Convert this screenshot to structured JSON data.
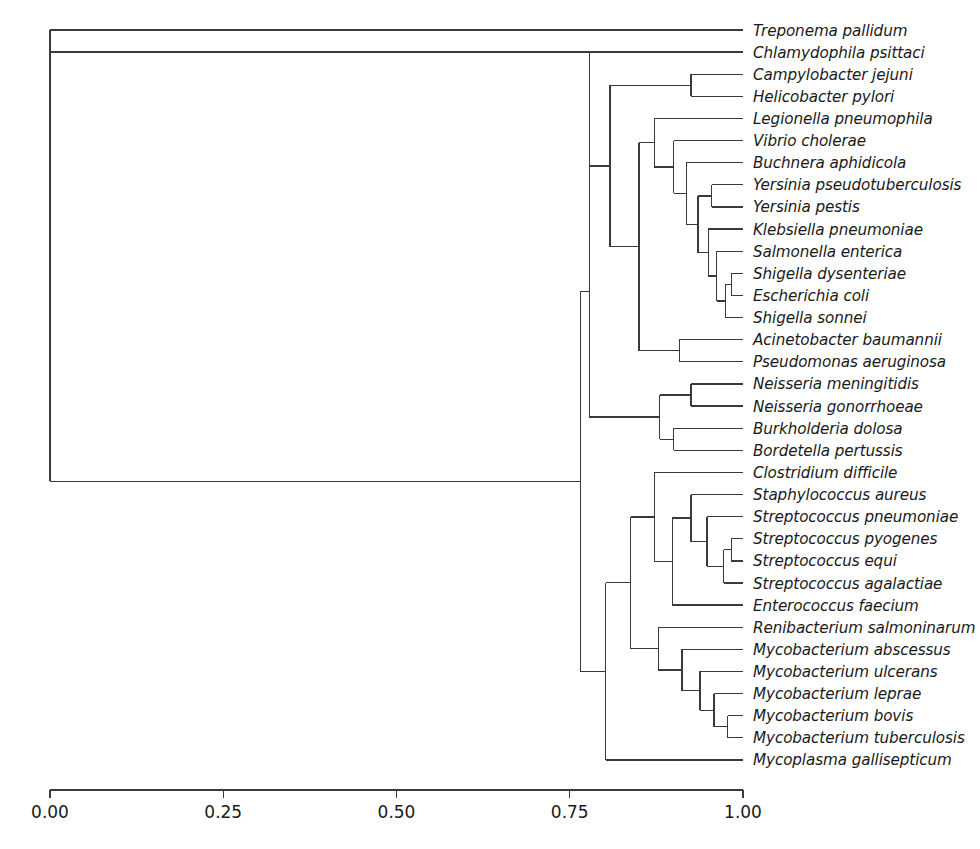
{
  "figure": {
    "type": "dendrogram",
    "title": "",
    "background_color": "#ffffff",
    "line_color": "#3a3a3a",
    "text_color": "#1a1a1a"
  },
  "axis": {
    "orientation": "horizontal-bottom",
    "ticks": [
      "0.00",
      "0.25",
      "0.50",
      "0.75",
      "1.00"
    ],
    "tick_values": [
      0.0,
      0.25,
      0.5,
      0.75,
      1.0
    ],
    "label": "",
    "range": [
      0.0,
      1.0
    ]
  },
  "chart_data": {
    "type": "line",
    "subtype": "dendrogram",
    "title": "",
    "xlabel": "",
    "ylabel": "",
    "xlim": [
      0.0,
      1.0
    ],
    "grid": false,
    "legend": "none",
    "orientation": "left-to-right",
    "leaf_count": 34,
    "leaves": [
      {
        "index": 0,
        "label": "Treponema pallidum",
        "merge_height": 0.0
      },
      {
        "index": 1,
        "label": "Chlamydophila psittaci",
        "merge_height": 0.0
      },
      {
        "index": 2,
        "label": "Campylobacter jejuni",
        "merge_height": 0.0
      },
      {
        "index": 3,
        "label": "Helicobacter pylori",
        "merge_height": 0.0
      },
      {
        "index": 4,
        "label": "Legionella pneumophila",
        "merge_height": 0.0
      },
      {
        "index": 5,
        "label": "Vibrio cholerae",
        "merge_height": 0.0
      },
      {
        "index": 6,
        "label": "Buchnera aphidicola",
        "merge_height": 0.0
      },
      {
        "index": 7,
        "label": "Yersinia pseudotuberculosis",
        "merge_height": 0.0
      },
      {
        "index": 8,
        "label": "Yersinia pestis",
        "merge_height": 0.0
      },
      {
        "index": 9,
        "label": "Klebsiella pneumoniae",
        "merge_height": 0.0
      },
      {
        "index": 10,
        "label": "Salmonella enterica",
        "merge_height": 0.0
      },
      {
        "index": 11,
        "label": "Shigella dysenteriae",
        "merge_height": 0.0
      },
      {
        "index": 12,
        "label": "Escherichia coli",
        "merge_height": 0.0
      },
      {
        "index": 13,
        "label": "Shigella sonnei",
        "merge_height": 0.0
      },
      {
        "index": 14,
        "label": "Acinetobacter baumannii",
        "merge_height": 0.0
      },
      {
        "index": 15,
        "label": "Pseudomonas aeruginosa",
        "merge_height": 0.0
      },
      {
        "index": 16,
        "label": "Neisseria meningitidis",
        "merge_height": 0.0
      },
      {
        "index": 17,
        "label": "Neisseria gonorrhoeae",
        "merge_height": 0.0
      },
      {
        "index": 18,
        "label": "Burkholderia dolosa",
        "merge_height": 0.0
      },
      {
        "index": 19,
        "label": "Bordetella pertussis",
        "merge_height": 0.0
      },
      {
        "index": 20,
        "label": "Clostridium difficile",
        "merge_height": 0.0
      },
      {
        "index": 21,
        "label": "Staphylococcus aureus",
        "merge_height": 0.0
      },
      {
        "index": 22,
        "label": "Streptococcus pneumoniae",
        "merge_height": 0.0
      },
      {
        "index": 23,
        "label": "Streptococcus pyogenes",
        "merge_height": 0.0
      },
      {
        "index": 24,
        "label": "Streptococcus equi",
        "merge_height": 0.0
      },
      {
        "index": 25,
        "label": "Streptococcus agalactiae",
        "merge_height": 0.0
      },
      {
        "index": 26,
        "label": "Enterococcus faecium",
        "merge_height": 0.0
      },
      {
        "index": 27,
        "label": "Renibacterium salmoninarum",
        "merge_height": 0.0
      },
      {
        "index": 28,
        "label": "Mycobacterium abscessus",
        "merge_height": 0.0
      },
      {
        "index": 29,
        "label": "Mycobacterium ulcerans",
        "merge_height": 0.0
      },
      {
        "index": 30,
        "label": "Mycobacterium leprae",
        "merge_height": 0.0
      },
      {
        "index": 31,
        "label": "Mycobacterium bovis",
        "merge_height": 0.0
      },
      {
        "index": 32,
        "label": "Mycobacterium tuberculosis",
        "merge_height": 0.0
      },
      {
        "index": 33,
        "label": "Mycoplasma gallisepticum",
        "merge_height": 0.0
      }
    ],
    "merges": [
      {
        "id": "n_campy_helico",
        "children": [
          "leaf:2",
          "leaf:3"
        ],
        "height": 0.925
      },
      {
        "id": "n_yersinia",
        "children": [
          "leaf:7",
          "leaf:8"
        ],
        "height": 0.955
      },
      {
        "id": "n_shig_ecoli",
        "children": [
          "leaf:11",
          "leaf:12"
        ],
        "height": 0.983
      },
      {
        "id": "n_shig3",
        "children": [
          "n_shig_ecoli",
          "leaf:13"
        ],
        "height": 0.975
      },
      {
        "id": "n_salm_shig",
        "children": [
          "leaf:10",
          "n_shig3"
        ],
        "height": 0.962
      },
      {
        "id": "n_kleb",
        "children": [
          "leaf:9",
          "n_salm_shig"
        ],
        "height": 0.95
      },
      {
        "id": "n_entero_core",
        "children": [
          "n_yersinia",
          "n_kleb"
        ],
        "height": 0.935
      },
      {
        "id": "n_buchnera",
        "children": [
          "leaf:6",
          "n_entero_core"
        ],
        "height": 0.918
      },
      {
        "id": "n_vibrio",
        "children": [
          "leaf:5",
          "n_buchnera"
        ],
        "height": 0.9
      },
      {
        "id": "n_legionella",
        "children": [
          "leaf:4",
          "n_vibrio"
        ],
        "height": 0.872
      },
      {
        "id": "n_acineto_pseudo",
        "children": [
          "leaf:14",
          "leaf:15"
        ],
        "height": 0.908
      },
      {
        "id": "n_gamma",
        "children": [
          "n_legionella",
          "n_acineto_pseudo"
        ],
        "height": 0.85
      },
      {
        "id": "n_campy_gamma",
        "children": [
          "n_campy_helico",
          "n_gamma"
        ],
        "height": 0.808
      },
      {
        "id": "n_neisseria",
        "children": [
          "leaf:16",
          "leaf:17"
        ],
        "height": 0.925
      },
      {
        "id": "n_burk_bord",
        "children": [
          "leaf:18",
          "leaf:19"
        ],
        "height": 0.9
      },
      {
        "id": "n_beta",
        "children": [
          "n_neisseria",
          "n_burk_bord"
        ],
        "height": 0.88
      },
      {
        "id": "n_proteo",
        "children": [
          "n_campy_gamma",
          "n_beta"
        ],
        "height": 0.778
      },
      {
        "id": "n_strep_pyo_equi",
        "children": [
          "leaf:23",
          "leaf:24"
        ],
        "height": 0.983
      },
      {
        "id": "n_strep_aga",
        "children": [
          "n_strep_pyo_equi",
          "leaf:25"
        ],
        "height": 0.972
      },
      {
        "id": "n_strep",
        "children": [
          "leaf:22",
          "n_strep_aga"
        ],
        "height": 0.948
      },
      {
        "id": "n_staph_strep",
        "children": [
          "leaf:21",
          "n_strep"
        ],
        "height": 0.925
      },
      {
        "id": "n_entero",
        "children": [
          "n_staph_strep",
          "leaf:26"
        ],
        "height": 0.898
      },
      {
        "id": "n_firmicutes",
        "children": [
          "leaf:20",
          "n_entero"
        ],
        "height": 0.872
      },
      {
        "id": "n_myco_bovis_tb",
        "children": [
          "leaf:31",
          "leaf:32"
        ],
        "height": 0.978
      },
      {
        "id": "n_myco_leprae",
        "children": [
          "leaf:30",
          "n_myco_bovis_tb"
        ],
        "height": 0.958
      },
      {
        "id": "n_myco_ulcerans",
        "children": [
          "leaf:29",
          "n_myco_leprae"
        ],
        "height": 0.938
      },
      {
        "id": "n_myco_absc",
        "children": [
          "leaf:28",
          "n_myco_ulcerans"
        ],
        "height": 0.912
      },
      {
        "id": "n_actino",
        "children": [
          "leaf:27",
          "n_myco_absc"
        ],
        "height": 0.878
      },
      {
        "id": "n_gram_pos",
        "children": [
          "n_firmicutes",
          "n_actino"
        ],
        "height": 0.838
      },
      {
        "id": "n_bacteria_low",
        "children": [
          "n_gram_pos",
          "leaf:33"
        ],
        "height": 0.802
      },
      {
        "id": "n_main",
        "children": [
          "n_proteo",
          "n_bacteria_low"
        ],
        "height": 0.765
      },
      {
        "id": "n_chlamydia",
        "children": [
          "leaf:1",
          "n_main"
        ],
        "height": 0.0
      },
      {
        "id": "n_root",
        "children": [
          "leaf:0",
          "n_chlamydia"
        ],
        "height": 0.0
      }
    ]
  },
  "geometry": {
    "x_zero_px": 50,
    "x_one_px": 743,
    "leaf_first_y_px": 30,
    "leaf_spacing_px": 22.12,
    "label_offset_px": 10,
    "axis_y_px": 790,
    "tick_length_px": 8
  }
}
